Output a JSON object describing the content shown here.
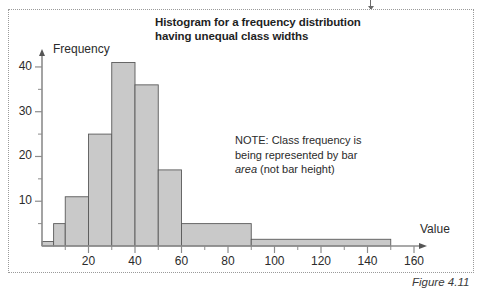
{
  "figure": {
    "caption": "Figure 4.11",
    "title_line1": "Histogram for a frequency distribution",
    "title_line2": "having unequal class widths"
  },
  "note": {
    "line1": "NOTE: Class frequency is",
    "line2": "being represented by bar",
    "emphasis": "area",
    "line3_rest": " (not bar height)"
  },
  "axes": {
    "y_title": "Frequency",
    "x_title": "Value",
    "y_ticks": [
      "10",
      "20",
      "30",
      "40"
    ],
    "x_ticks": [
      "20",
      "40",
      "60",
      "80",
      "100",
      "120",
      "140",
      "160"
    ]
  },
  "colors": {
    "bar_fill": "#c9c9c9",
    "bar_stroke": "#5a5a5a",
    "axis": "#8c8c8c",
    "text": "#2b2b2b",
    "frame": "#9a9a9a"
  },
  "chart_data": {
    "type": "bar",
    "title": "Histogram for a frequency distribution having unequal class widths",
    "xlabel": "Value",
    "ylabel": "Frequency",
    "xlim": [
      0,
      160
    ],
    "ylim": [
      0,
      42
    ],
    "grid": false,
    "legend": "none",
    "annotation": "NOTE: Class frequency is being represented by bar area (not bar height)",
    "x_tick_values": [
      20,
      40,
      60,
      80,
      100,
      120,
      140,
      160
    ],
    "x_minor_tick_step": 10,
    "y_tick_values": [
      10,
      20,
      30,
      40
    ],
    "y_minor_tick_step": 5,
    "bin_edges": [
      0,
      5,
      10,
      20,
      30,
      40,
      50,
      60,
      90,
      150
    ],
    "bar_heights": [
      1,
      5,
      11,
      25,
      41,
      36,
      17,
      5,
      1.5
    ],
    "bars": [
      {
        "x0": 0,
        "x1": 5,
        "height": 1
      },
      {
        "x0": 5,
        "x1": 10,
        "height": 5
      },
      {
        "x0": 10,
        "x1": 20,
        "height": 11
      },
      {
        "x0": 20,
        "x1": 30,
        "height": 25
      },
      {
        "x0": 30,
        "x1": 40,
        "height": 41
      },
      {
        "x0": 40,
        "x1": 50,
        "height": 36
      },
      {
        "x0": 50,
        "x1": 60,
        "height": 17
      },
      {
        "x0": 60,
        "x1": 90,
        "height": 5
      },
      {
        "x0": 90,
        "x1": 150,
        "height": 1.5
      }
    ]
  }
}
